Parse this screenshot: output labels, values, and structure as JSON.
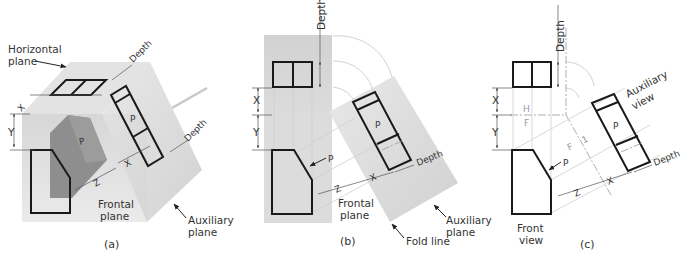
{
  "figure": {
    "panels": [
      {
        "id": "a",
        "caption": "(a)",
        "labels": {
          "horizontal_plane_1": "Horizontal",
          "horizontal_plane_2": "plane",
          "frontal_plane_1": "Frontal",
          "frontal_plane_2": "plane",
          "auxiliary_plane_1": "Auxiliary",
          "auxiliary_plane_2": "plane",
          "depth_top": "Depth",
          "depth_right": "Depth",
          "surface": "P",
          "dim_x_top": "X",
          "dim_y": "Y",
          "dim_x": "X",
          "dim_z": "Z"
        }
      },
      {
        "id": "b",
        "caption": "(b)",
        "labels": {
          "depth_top": "Depth",
          "depth_right": "Depth",
          "dim_x_left": "X",
          "dim_y": "Y",
          "dim_x": "X",
          "dim_z": "Z",
          "surface_aux": "P",
          "surface_front": "P",
          "frontal_plane_1": "Frontal",
          "frontal_plane_2": "plane",
          "auxiliary_plane_1": "Auxiliary",
          "auxiliary_plane_2": "plane",
          "fold_line": "Fold line"
        }
      },
      {
        "id": "c",
        "caption": "(c)",
        "labels": {
          "depth_top": "Depth",
          "depth_right": "Depth",
          "dim_x_left": "X",
          "dim_y": "Y",
          "dim_x": "X",
          "dim_z": "Z",
          "fold_h": "H",
          "fold_f": "F",
          "fold_f2": "F",
          "fold_1": "1",
          "surface_aux": "P",
          "surface_front": "P",
          "auxiliary_view_1": "Auxiliary",
          "auxiliary_view_2": "view",
          "front_view_1": "Front",
          "front_view_2": "view"
        }
      }
    ],
    "colors": {
      "object_line": "#1a1a1a",
      "plane_fill": "#d9d9d9",
      "shaded_object": "#8c8c8c",
      "projection_line": "#cfcfcf",
      "text": "#333333"
    }
  }
}
